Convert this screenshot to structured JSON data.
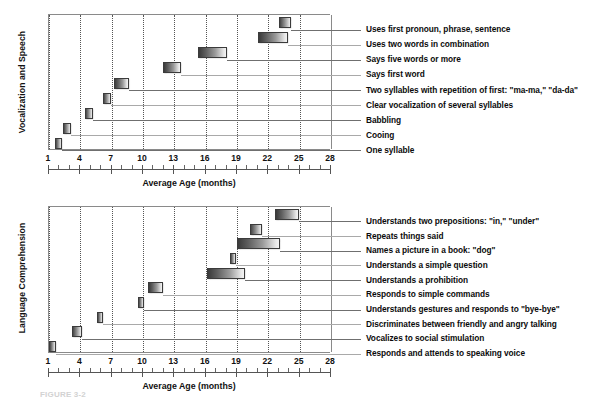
{
  "figure": {
    "caption_partial": "FIGURE 3-2",
    "x_axis_title": "Average Age (months)",
    "x_ticks": [
      1,
      4,
      7,
      10,
      13,
      16,
      19,
      22,
      25,
      28
    ],
    "x_min": 1,
    "x_max": 28,
    "colors": {
      "bar_dark": "#3a3a3a",
      "bar_light": "#f4f4f4",
      "bar_border": "#3b3b3b",
      "gridline": "#555555",
      "frame": "#8a8a8a",
      "leader": "#6f6f6f",
      "text": "#0b0b0b"
    }
  },
  "chart_data": [
    {
      "type": "bar",
      "orientation": "horizontal-range",
      "title": "Vocalization and Speech",
      "ylabel": "Vocalization and Speech",
      "xlabel": "Average Age (months)",
      "xlim": [
        1,
        28
      ],
      "xticks": [
        1,
        4,
        7,
        10,
        13,
        16,
        19,
        22,
        25,
        28
      ],
      "grid": "vertical-dotted",
      "legend": "none",
      "categories": [
        "Uses first pronoun, phrase, sentence",
        "Uses two words in combination",
        "Says five words or more",
        "Says first word",
        "Two syllables with repetition of first: \"ma-ma,\" \"da-da\"",
        "Clear vocalization of several syllables",
        "Babbling",
        "Cooing",
        "One syllable"
      ],
      "ranges": [
        {
          "label": "Uses first pronoun, phrase, sentence",
          "start": 23.0,
          "end": 24.2
        },
        {
          "label": "Uses two words in combination",
          "start": 21.0,
          "end": 23.9
        },
        {
          "label": "Says five words or more",
          "start": 15.3,
          "end": 18.0
        },
        {
          "label": "Says first word",
          "start": 11.9,
          "end": 13.6
        },
        {
          "label": "Two syllables with repetition of first: \"ma-ma,\" \"da-da\"",
          "start": 7.2,
          "end": 8.7
        },
        {
          "label": "Clear vocalization of several syllables",
          "start": 6.2,
          "end": 6.9
        },
        {
          "label": "Babbling",
          "start": 4.4,
          "end": 5.2
        },
        {
          "label": "Cooing",
          "start": 2.3,
          "end": 3.1
        },
        {
          "label": "One syllable",
          "start": 1.6,
          "end": 2.2
        }
      ]
    },
    {
      "type": "bar",
      "orientation": "horizontal-range",
      "title": "Language Comprehension",
      "ylabel": "Language Comprehension",
      "xlabel": "Average Age (months)",
      "xlim": [
        1,
        28
      ],
      "xticks": [
        1,
        4,
        7,
        10,
        13,
        16,
        19,
        22,
        25,
        28
      ],
      "grid": "vertical-dotted",
      "legend": "none",
      "categories": [
        "Understands two prepositions: \"in,\" \"under\"",
        "Repeats things said",
        "Names a picture in a book: \"dog\"",
        "Understands a simple question",
        "Understands a prohibition",
        "Responds to simple commands",
        "Understands gestures and responds to \"bye-bye\"",
        "Discriminates between friendly and angry talking",
        "Vocalizes to social stimulation",
        "Responds and attends to speaking voice"
      ],
      "ranges": [
        {
          "label": "Understands two prepositions: \"in,\" \"under\"",
          "start": 22.6,
          "end": 24.9
        },
        {
          "label": "Repeats things said",
          "start": 20.2,
          "end": 21.4
        },
        {
          "label": "Names a picture in a book: \"dog\"",
          "start": 19.0,
          "end": 23.1
        },
        {
          "label": "Understands a simple question",
          "start": 18.3,
          "end": 18.9
        },
        {
          "label": "Understands a prohibition",
          "start": 16.1,
          "end": 19.8
        },
        {
          "label": "Responds to simple commands",
          "start": 10.5,
          "end": 11.9
        },
        {
          "label": "Understands gestures and responds to \"bye-bye\"",
          "start": 9.5,
          "end": 10.1
        },
        {
          "label": "Discriminates between friendly and angry talking",
          "start": 5.6,
          "end": 6.2
        },
        {
          "label": "Vocalizes to social stimulation",
          "start": 3.2,
          "end": 4.2
        },
        {
          "label": "Responds and attends to speaking voice",
          "start": 1.0,
          "end": 1.7
        }
      ]
    }
  ]
}
